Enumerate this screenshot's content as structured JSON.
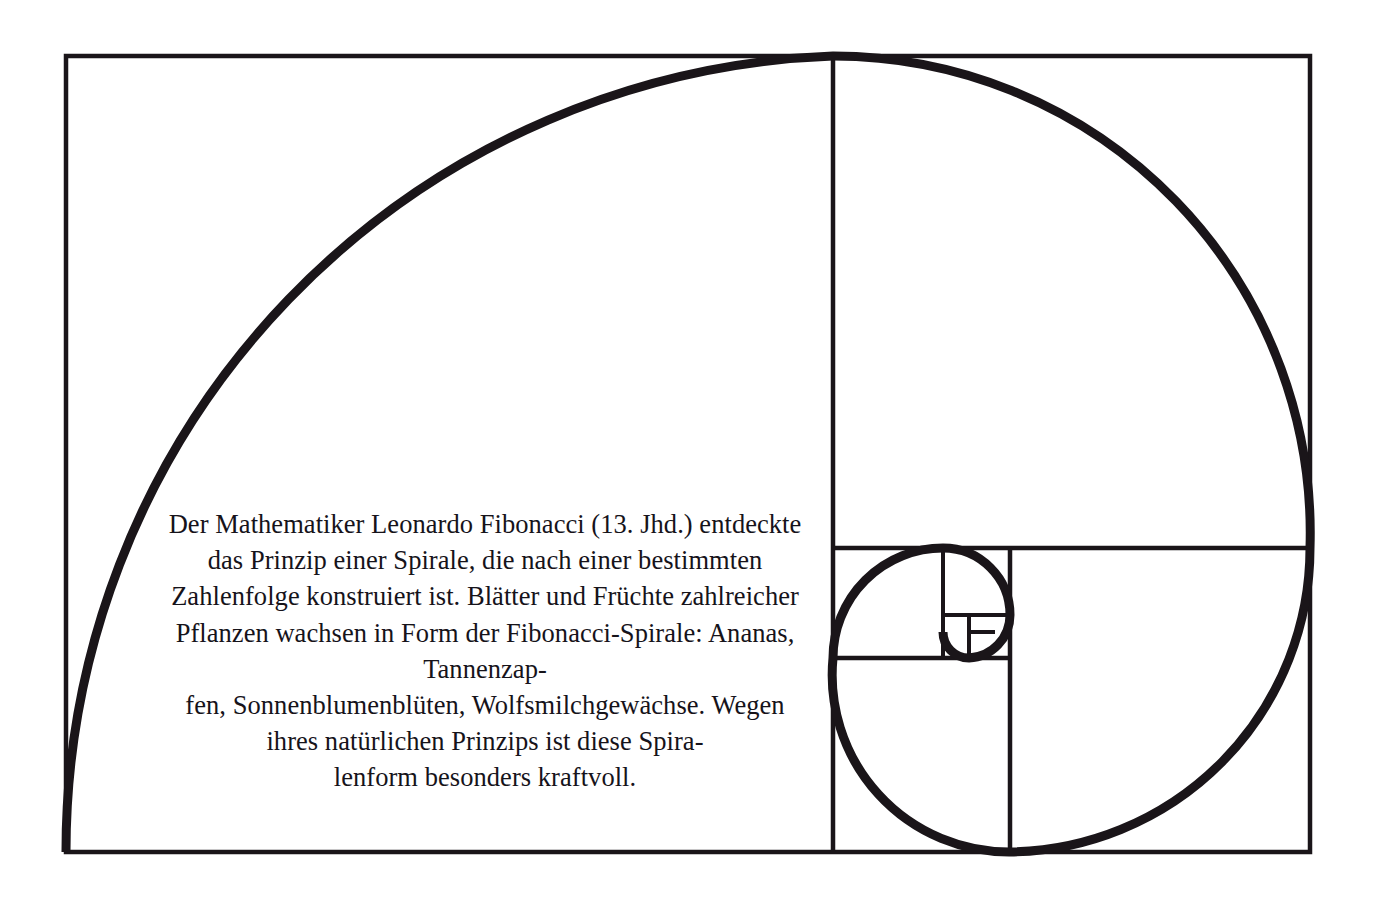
{
  "page": {
    "background_color": "#ffffff",
    "ink_color": "#1a1519",
    "width": 1378,
    "height": 902
  },
  "caption": {
    "text": "Der Mathematiker Leonardo Fibonacci (13. Jhd.) entdeckte das Prinzip einer Spirale, die nach einer bestimmten Zahlenfolge konstruiert ist. Blätter und Früchte zahlreicher Pflanzen wachsen in Form der Fibonacci-Spirale: Ananas, Tannenzap-\nfen, Sonnenblumenblüten, Wolfsmilchgewächse. Wegen ihres natürlichen Prinzips ist diese Spira-\nlenform besonders kraftvoll.",
    "lines": [
      "Der Mathematiker Leonardo Fibonacci (13. Jhd.)",
      "entdeckte das Prinzip einer Spirale, die nach einer",
      "bestimmten Zahlenfolge konstruiert ist. Blätter",
      "und Früchte zahlreicher Pflanzen wachsen in",
      "Form der Fibonacci-Spirale: Ananas, Tannenzap-",
      "fen, Sonnenblumenblüten, Wolfsmilchgewächse.",
      "Wegen ihres natürlichen Prinzips ist diese Spira-",
      "lenform besonders kraftvoll."
    ],
    "align": "center",
    "language": "de"
  },
  "diagram": {
    "name": "fibonacci-golden-spiral",
    "frame": {
      "x": 66,
      "y": 56,
      "width": 1244,
      "height": 796
    },
    "frame_stroke_width": 4.5,
    "spiral_stroke_width": 9,
    "stroke_color": "#1a1519",
    "fill": "none",
    "squares": [
      {
        "label": "square-1-largest",
        "x": 66,
        "y": 56,
        "size": 796
      },
      {
        "label": "square-2",
        "x": 833,
        "y": 548,
        "size": 304,
        "note": "right-lower large square region"
      },
      {
        "label": "square-3",
        "x": 833,
        "y": 548,
        "size": 177
      },
      {
        "label": "square-4",
        "x": 833,
        "y": 548,
        "size": 110
      },
      {
        "label": "square-5",
        "x": 943,
        "y": 548,
        "size": 67
      },
      {
        "label": "square-6",
        "x": 943,
        "y": 615,
        "size": 43
      },
      {
        "label": "square-7",
        "x": 969,
        "y": 615,
        "size": 26
      }
    ],
    "divider_lines": [
      {
        "label": "main-vertical-divider",
        "x1": 833,
        "y1": 56,
        "x2": 833,
        "y2": 852
      },
      {
        "label": "right-horizontal-divider",
        "x1": 833,
        "y1": 548,
        "x2": 1310,
        "y2": 548
      },
      {
        "label": "inner-vertical-divider",
        "x1": 1010,
        "y1": 548,
        "x2": 1010,
        "y2": 852
      },
      {
        "label": "inner-horizontal-divider",
        "x1": 833,
        "y1": 658,
        "x2": 1010,
        "y2": 658
      },
      {
        "label": "tiny-vertical-divider",
        "x1": 943,
        "y1": 548,
        "x2": 943,
        "y2": 658
      },
      {
        "label": "tiny-horizontal-divider",
        "x1": 943,
        "y1": 615,
        "x2": 1010,
        "y2": 615
      },
      {
        "label": "micro-vertical-divider",
        "x1": 969,
        "y1": 615,
        "x2": 969,
        "y2": 658
      }
    ],
    "spiral_arcs": [
      {
        "label": "arc-1",
        "from": [
          66,
          852
        ],
        "to": [
          833,
          56
        ],
        "radius": 796,
        "center": [
          66,
          56
        ]
      },
      {
        "label": "arc-2",
        "from": [
          833,
          56
        ],
        "to": [
          1310,
          548
        ],
        "radius": 477,
        "center": [
          1310,
          56
        ]
      },
      {
        "label": "arc-3",
        "from": [
          1310,
          548
        ],
        "to": [
          1010,
          852
        ],
        "radius": 304,
        "center": [
          1310,
          852
        ]
      },
      {
        "label": "arc-4",
        "from": [
          1010,
          852
        ],
        "to": [
          833,
          658
        ],
        "radius": 177,
        "center": [
          833,
          852
        ]
      },
      {
        "label": "arc-5",
        "from": [
          833,
          658
        ],
        "to": [
          943,
          548
        ],
        "radius": 110,
        "center": [
          833,
          548
        ]
      },
      {
        "label": "arc-6",
        "from": [
          943,
          548
        ],
        "to": [
          1010,
          615
        ],
        "radius": 67,
        "center": [
          1010,
          548
        ]
      },
      {
        "label": "arc-7",
        "from": [
          1010,
          615
        ],
        "to": [
          969,
          658
        ],
        "radius": 43,
        "center": [
          1010,
          658
        ]
      },
      {
        "label": "arc-8",
        "from": [
          969,
          658
        ],
        "to": [
          943,
          632
        ],
        "radius": 26,
        "center": [
          969,
          632
        ]
      }
    ]
  }
}
